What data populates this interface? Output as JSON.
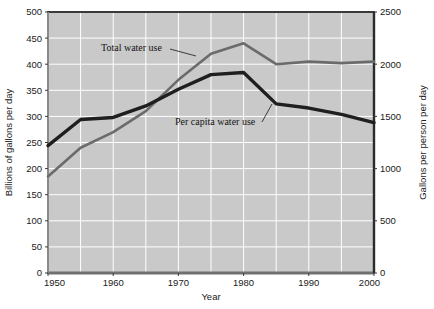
{
  "chart_data": {
    "type": "line",
    "title": "",
    "xlabel": "Year",
    "ylabel": "Billions of gallons per day",
    "y2label": "Gallons per person per day",
    "x": [
      1950,
      1955,
      1960,
      1965,
      1970,
      1975,
      1980,
      1985,
      1990,
      1995,
      2000
    ],
    "xlim": [
      1950,
      2000
    ],
    "xticks": [
      1950,
      1960,
      1970,
      1980,
      1990,
      2000
    ],
    "xtick_labels": [
      "1950",
      "1960",
      "1970",
      "1980",
      "1990",
      "2000"
    ],
    "ylim": [
      0,
      500
    ],
    "yticks": [
      0,
      50,
      100,
      150,
      200,
      250,
      300,
      350,
      400,
      450,
      500
    ],
    "ytick_labels": [
      "0",
      "50",
      "100",
      "150",
      "200",
      "250",
      "300",
      "350",
      "400",
      "450",
      "500"
    ],
    "y2lim": [
      0,
      2500
    ],
    "y2ticks": [
      0,
      500,
      1000,
      1500,
      2000,
      2500
    ],
    "y2tick_labels": [
      "0",
      "500",
      "1000",
      "1500",
      "2000",
      "2500"
    ],
    "grid": true,
    "grid_color": "#ffffff",
    "plot_bg": "#c9c9c9",
    "legend_position": "inline-annotation",
    "series": [
      {
        "name": "Total water use",
        "axis": "left",
        "color": "#6b6b6b",
        "width": 2.6,
        "values": [
          185,
          240,
          270,
          310,
          370,
          420,
          440,
          400,
          405,
          402,
          405
        ]
      },
      {
        "name": "Per capita water use",
        "axis": "right",
        "color": "#1f1f1f",
        "width": 3.4,
        "values": [
          1220,
          1470,
          1490,
          1600,
          1760,
          1900,
          1920,
          1620,
          1580,
          1520,
          1440
        ]
      }
    ],
    "annotations": [
      {
        "text": "Total water use",
        "text_x": 101,
        "text_y": 51,
        "leader": [
          [
            170,
            49
          ],
          [
            196,
            56
          ]
        ]
      },
      {
        "text": "Per capita water use",
        "text_x": 175,
        "text_y": 125,
        "leader": [
          [
            262,
            122
          ],
          [
            272,
            104
          ]
        ]
      }
    ]
  },
  "footer": {
    "source_note": ""
  }
}
